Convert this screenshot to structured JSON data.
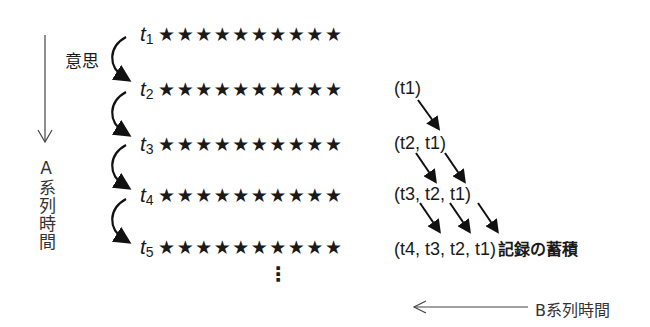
{
  "diagram": {
    "rows": [
      {
        "label": "t",
        "sub": "1",
        "stars": "★★★★★★★★★★",
        "record": ""
      },
      {
        "label": "t",
        "sub": "2",
        "stars": "★★★★★★★★★★",
        "record": "(t1)"
      },
      {
        "label": "t",
        "sub": "3",
        "stars": "★★★★★★★★★★",
        "record": "(t2, t1)"
      },
      {
        "label": "t",
        "sub": "4",
        "stars": "★★★★★★★★★★",
        "record": "(t3, t2, t1)"
      },
      {
        "label": "t",
        "sub": "5",
        "stars": "★★★★★★★★★★",
        "record": "(t4, t3, t2, t1)"
      }
    ],
    "will_label": "意思",
    "a_series_label": "A系列時間",
    "b_series_label": "B系列時間",
    "accumulation_label": "記録の蓄積",
    "ellipsis": "⋮"
  }
}
